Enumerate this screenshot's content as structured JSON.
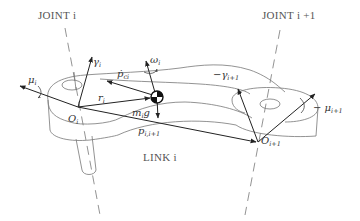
{
  "diagram": {
    "labels": {
      "joint_i": "JOINT i",
      "joint_i1": "JOINT i +1",
      "link_i": "LINK i",
      "O_i": {
        "main": "O",
        "sub": "i"
      },
      "O_i1": {
        "main": "O",
        "sub": "i+1"
      },
      "gamma_i": {
        "main": "γ",
        "sub": "i"
      },
      "neg_gamma_i1": {
        "main": "−γ",
        "sub": "i+1"
      },
      "mu_i": {
        "main": "μ",
        "sub": "i"
      },
      "neg_mu_i1": {
        "main": "− μ",
        "sub": "i+1"
      },
      "omega_i": {
        "main": "ω",
        "sub": "i"
      },
      "p_ci_dot": {
        "main": "ṗ",
        "sub": "ci"
      },
      "r_i": {
        "main": "r",
        "sub": "i"
      },
      "m_i_g": {
        "main": "m",
        "sub": "i",
        "tail": "g"
      },
      "p_i_i1": {
        "main": "p",
        "sub": "i,i+1"
      }
    },
    "colors": {
      "line": "#777777",
      "vector": "#222222",
      "text": "#333333",
      "background": "#ffffff"
    }
  }
}
